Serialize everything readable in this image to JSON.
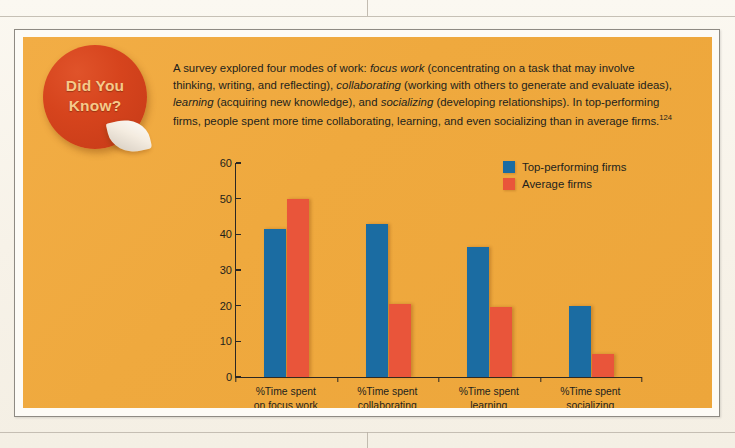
{
  "badge": {
    "line1": "Did You",
    "line2": "Know?",
    "color": "#d6441d"
  },
  "intro": {
    "segments": [
      {
        "text": "A survey explored four modes of work: ",
        "style": "normal"
      },
      {
        "text": "focus work",
        "style": "italic"
      },
      {
        "text": " (concentrating on a task that may involve thinking, writing, and reflecting), ",
        "style": "normal"
      },
      {
        "text": "collaborating",
        "style": "italic"
      },
      {
        "text": " (working with others to generate and evaluate ideas), ",
        "style": "normal"
      },
      {
        "text": "learning",
        "style": "italic"
      },
      {
        "text": " (acquiring new knowledge), and ",
        "style": "normal"
      },
      {
        "text": "socializing",
        "style": "italic"
      },
      {
        "text": " (developing relationships). In top-performing firms, people spent more time collaborating, learning, and even socializing than in average firms.",
        "style": "normal"
      },
      {
        "text": "124",
        "style": "superscript"
      }
    ],
    "footnote": "124"
  },
  "chart_data": {
    "type": "bar",
    "title": "",
    "xlabel": "",
    "ylabel": "",
    "ylim": [
      0,
      60
    ],
    "yticks": [
      60,
      50,
      40,
      30,
      20,
      10,
      0
    ],
    "grid": false,
    "legend_position": "top-right",
    "categories": [
      "%Time spent on focus work",
      "%Time spent collaborating",
      "%Time spent learning",
      "%Time spent socializing"
    ],
    "category_lines": [
      [
        "%Time spent",
        "on focus work"
      ],
      [
        "%Time spent",
        "collaborating"
      ],
      [
        "%Time spent",
        "learning"
      ],
      [
        "%Time spent",
        "socializing"
      ]
    ],
    "series": [
      {
        "name": "Top-performing firms",
        "color": "#1b6ca2",
        "values": [
          41.5,
          43,
          36.5,
          20
        ]
      },
      {
        "name": "Average firms",
        "color": "#e9553a",
        "values": [
          50,
          20.5,
          19.7,
          6.5
        ]
      }
    ]
  }
}
